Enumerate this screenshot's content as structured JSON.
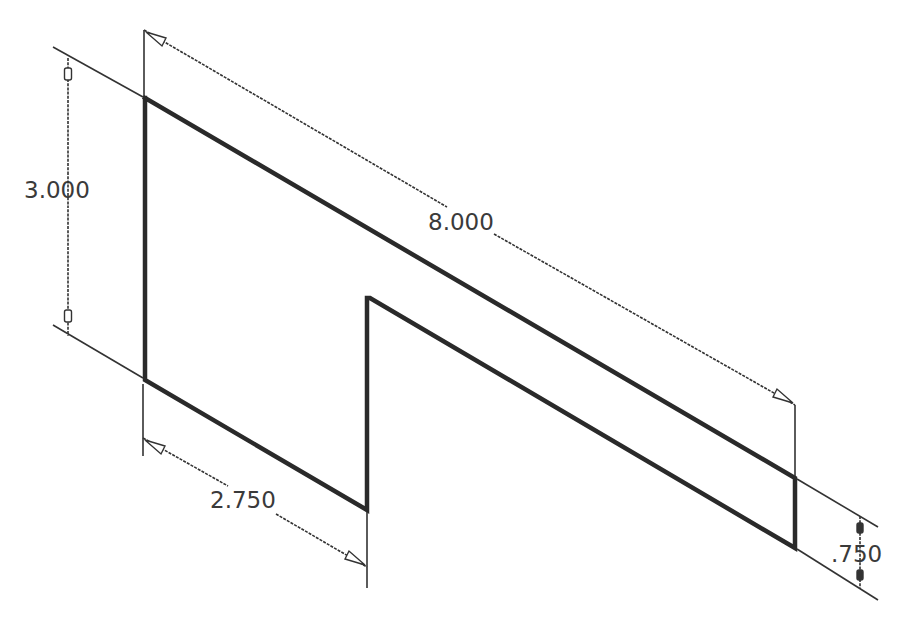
{
  "drawing": {
    "title": "Isometric sketch with dimensions",
    "colors": {
      "line": "#2a2a2a",
      "dim": "#333333",
      "text": "#3a3a3a",
      "background": "#ffffff"
    },
    "profile": {
      "points": [
        [
          145,
          98
        ],
        [
          795,
          478
        ],
        [
          795,
          548
        ],
        [
          367,
          298
        ],
        [
          367,
          510
        ],
        [
          145,
          380
        ]
      ]
    },
    "dimensions": [
      {
        "id": "height",
        "label": "3.000",
        "text_x": 24,
        "text_y": 198
      },
      {
        "id": "length",
        "label": "8.000",
        "text_x": 428,
        "text_y": 230
      },
      {
        "id": "offset",
        "label": "2.750",
        "text_x": 210,
        "text_y": 508
      },
      {
        "id": "thickness",
        "label": ".750",
        "text_x": 831,
        "text_y": 562
      }
    ]
  }
}
